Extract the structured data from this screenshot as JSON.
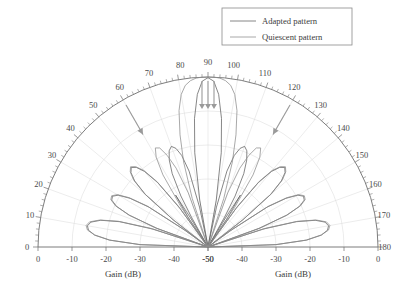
{
  "chart_data": {
    "type": "line",
    "title": "",
    "subtitle": "",
    "plot_kind": "polar-semicircle-antenna-pattern",
    "xlabel": "Gain (dB)",
    "xlabel_left": "Gain (dB)",
    "xlabel_right": "Gain (dB)",
    "ylabel": "",
    "angle_unit": "degrees",
    "angle_range": [
      0,
      180
    ],
    "angle_tick_labels": [
      "0",
      "10",
      "20",
      "30",
      "40",
      "50",
      "60",
      "70",
      "80",
      "90",
      "100",
      "110",
      "120",
      "130",
      "140",
      "150",
      "160",
      "170",
      "180"
    ],
    "angle_tick_values": [
      0,
      10,
      20,
      30,
      40,
      50,
      60,
      70,
      80,
      90,
      100,
      110,
      120,
      130,
      140,
      150,
      160,
      170,
      180
    ],
    "angle_minor_tick_step": 2,
    "radial_label": "Gain (dB)",
    "radial_range_db": [
      -50,
      0
    ],
    "radial_tick_labels_left": [
      "0",
      "-10",
      "-20",
      "-30",
      "-40",
      "-50"
    ],
    "radial_tick_values_left": [
      0,
      -10,
      -20,
      -30,
      -40,
      -50
    ],
    "radial_tick_labels_right": [
      "-50",
      "-40",
      "-30",
      "-20",
      "-10",
      "0"
    ],
    "radial_tick_values_right": [
      -50,
      -40,
      -30,
      -20,
      -10,
      0
    ],
    "grid": true,
    "grid_arcs_db": [
      -10,
      -20,
      -30,
      -40
    ],
    "grid_ray_step_deg": 10,
    "legend_position": "top-right",
    "legend": [
      "Adapted pattern",
      "Quiescent pattern"
    ],
    "series": [
      {
        "name": "Adapted pattern",
        "color": "#5f5f5f",
        "description": "Pattern with nulls steered toward interferers at 60 and 120 degrees",
        "points_deg_db": [
          [
            0,
            -50
          ],
          [
            2,
            -30
          ],
          [
            4,
            -21
          ],
          [
            6,
            -16.5
          ],
          [
            8,
            -14.5
          ],
          [
            10,
            -14.0
          ],
          [
            12,
            -14.8
          ],
          [
            14,
            -17.5
          ],
          [
            16,
            -23
          ],
          [
            18,
            -33
          ],
          [
            19,
            -50
          ],
          [
            20,
            -34
          ],
          [
            22,
            -25
          ],
          [
            24,
            -20.5
          ],
          [
            26,
            -18.5
          ],
          [
            28,
            -18.2
          ],
          [
            30,
            -19.5
          ],
          [
            32,
            -23
          ],
          [
            34,
            -29
          ],
          [
            36,
            -42
          ],
          [
            37,
            -50
          ],
          [
            38,
            -37
          ],
          [
            40,
            -26
          ],
          [
            42,
            -21
          ],
          [
            44,
            -18.5
          ],
          [
            46,
            -17.5
          ],
          [
            48,
            -18.5
          ],
          [
            50,
            -21
          ],
          [
            52,
            -26
          ],
          [
            54,
            -36
          ],
          [
            55,
            -50
          ],
          [
            56,
            -40
          ],
          [
            58,
            -32
          ],
          [
            59,
            -40
          ],
          [
            60,
            -50
          ],
          [
            61,
            -40
          ],
          [
            62,
            -33
          ],
          [
            64,
            -26
          ],
          [
            66,
            -22
          ],
          [
            68,
            -19.5
          ],
          [
            70,
            -18.5
          ],
          [
            72,
            -19.5
          ],
          [
            74,
            -22
          ],
          [
            76,
            -27
          ],
          [
            78,
            -38
          ],
          [
            79,
            -50
          ],
          [
            80,
            -36
          ],
          [
            82,
            -22
          ],
          [
            84,
            -12
          ],
          [
            86,
            -5
          ],
          [
            88,
            -1.2
          ],
          [
            90,
            -0.2
          ],
          [
            92,
            -1.2
          ],
          [
            94,
            -5
          ],
          [
            96,
            -12
          ],
          [
            98,
            -22
          ],
          [
            100,
            -36
          ],
          [
            101,
            -50
          ],
          [
            102,
            -38
          ],
          [
            104,
            -27
          ],
          [
            106,
            -22
          ],
          [
            108,
            -19.5
          ],
          [
            110,
            -18.5
          ],
          [
            112,
            -19.5
          ],
          [
            114,
            -22
          ],
          [
            116,
            -26
          ],
          [
            118,
            -33
          ],
          [
            119,
            -40
          ],
          [
            120,
            -50
          ],
          [
            121,
            -40
          ],
          [
            122,
            -32
          ],
          [
            124,
            -40
          ],
          [
            125,
            -50
          ],
          [
            126,
            -36
          ],
          [
            128,
            -26
          ],
          [
            130,
            -21
          ],
          [
            132,
            -18.5
          ],
          [
            134,
            -17.5
          ],
          [
            136,
            -18.5
          ],
          [
            138,
            -21
          ],
          [
            140,
            -26
          ],
          [
            142,
            -37
          ],
          [
            143,
            -50
          ],
          [
            144,
            -42
          ],
          [
            146,
            -29
          ],
          [
            148,
            -23
          ],
          [
            150,
            -19.5
          ],
          [
            152,
            -18.2
          ],
          [
            154,
            -18.5
          ],
          [
            156,
            -20.5
          ],
          [
            158,
            -25
          ],
          [
            160,
            -34
          ],
          [
            161,
            -50
          ],
          [
            162,
            -33
          ],
          [
            164,
            -23
          ],
          [
            166,
            -17.5
          ],
          [
            168,
            -14.8
          ],
          [
            170,
            -14.0
          ],
          [
            172,
            -14.5
          ],
          [
            174,
            -16.5
          ],
          [
            176,
            -21
          ],
          [
            178,
            -30
          ],
          [
            180,
            -50
          ]
        ]
      },
      {
        "name": "Quiescent pattern",
        "color": "#8c8c8c",
        "description": "Unadapted pattern without nulls at the interference angles",
        "points_deg_db": [
          [
            0,
            -50
          ],
          [
            2,
            -30
          ],
          [
            4,
            -21
          ],
          [
            6,
            -16.5
          ],
          [
            8,
            -14.2
          ],
          [
            10,
            -13.6
          ],
          [
            12,
            -14.4
          ],
          [
            14,
            -17.2
          ],
          [
            16,
            -22.5
          ],
          [
            18,
            -32
          ],
          [
            19,
            -50
          ],
          [
            20,
            -34
          ],
          [
            22,
            -25
          ],
          [
            24,
            -20.2
          ],
          [
            26,
            -18.2
          ],
          [
            28,
            -17.9
          ],
          [
            30,
            -19.2
          ],
          [
            32,
            -22.6
          ],
          [
            34,
            -28.5
          ],
          [
            36,
            -41
          ],
          [
            37,
            -50
          ],
          [
            38,
            -37
          ],
          [
            40,
            -25.6
          ],
          [
            42,
            -20.6
          ],
          [
            44,
            -18.2
          ],
          [
            46,
            -17.2
          ],
          [
            48,
            -18.2
          ],
          [
            50,
            -20.6
          ],
          [
            52,
            -25.5
          ],
          [
            54,
            -35
          ],
          [
            55,
            -50
          ],
          [
            56,
            -36
          ],
          [
            58,
            -25
          ],
          [
            60,
            -19.5
          ],
          [
            62,
            -17.0
          ],
          [
            64,
            -17.6
          ],
          [
            66,
            -20.5
          ],
          [
            68,
            -25
          ],
          [
            70,
            -33
          ],
          [
            71,
            -50
          ],
          [
            72,
            -35
          ],
          [
            74,
            -24
          ],
          [
            76,
            -16
          ],
          [
            78,
            -9
          ],
          [
            80,
            -4.5
          ],
          [
            82,
            -2.0
          ],
          [
            84,
            -0.8
          ],
          [
            86,
            -0.2
          ],
          [
            88,
            -0.02
          ],
          [
            90,
            0
          ],
          [
            92,
            -0.02
          ],
          [
            94,
            -0.2
          ],
          [
            96,
            -0.8
          ],
          [
            98,
            -2.0
          ],
          [
            100,
            -4.5
          ],
          [
            102,
            -9
          ],
          [
            104,
            -16
          ],
          [
            106,
            -24
          ],
          [
            108,
            -35
          ],
          [
            109,
            -50
          ],
          [
            110,
            -33
          ],
          [
            112,
            -25
          ],
          [
            114,
            -20.5
          ],
          [
            116,
            -17.6
          ],
          [
            118,
            -17.0
          ],
          [
            120,
            -19.5
          ],
          [
            122,
            -25
          ],
          [
            124,
            -36
          ],
          [
            125,
            -50
          ],
          [
            126,
            -35
          ],
          [
            128,
            -25.5
          ],
          [
            130,
            -20.6
          ],
          [
            132,
            -18.2
          ],
          [
            134,
            -17.2
          ],
          [
            136,
            -18.2
          ],
          [
            138,
            -20.6
          ],
          [
            140,
            -25.6
          ],
          [
            142,
            -37
          ],
          [
            143,
            -50
          ],
          [
            144,
            -41
          ],
          [
            146,
            -28.5
          ],
          [
            148,
            -22.6
          ],
          [
            150,
            -19.2
          ],
          [
            152,
            -17.9
          ],
          [
            154,
            -18.2
          ],
          [
            156,
            -20.2
          ],
          [
            158,
            -25
          ],
          [
            160,
            -34
          ],
          [
            161,
            -50
          ],
          [
            162,
            -32
          ],
          [
            164,
            -22.5
          ],
          [
            166,
            -17.2
          ],
          [
            168,
            -14.4
          ],
          [
            170,
            -13.6
          ],
          [
            172,
            -14.2
          ],
          [
            174,
            -16.5
          ],
          [
            176,
            -21
          ],
          [
            178,
            -30
          ],
          [
            180,
            -50
          ]
        ]
      }
    ],
    "annotations": [
      {
        "name": "null-arrow-90-left",
        "kind": "arrow-down",
        "angle_deg": 90,
        "offset_px": -6
      },
      {
        "name": "null-arrow-90-center",
        "kind": "arrow-down",
        "angle_deg": 90,
        "offset_px": 0
      },
      {
        "name": "null-arrow-90-right",
        "kind": "arrow-down",
        "angle_deg": 90,
        "offset_px": 6
      },
      {
        "name": "null-arrow-120",
        "kind": "arrow-radial",
        "angle_deg": 120
      },
      {
        "name": "null-arrow-60",
        "kind": "arrow-radial",
        "angle_deg": 60
      }
    ]
  }
}
